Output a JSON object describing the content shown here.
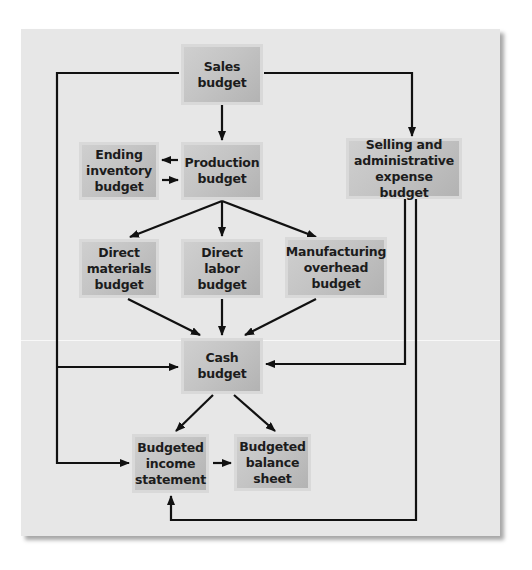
{
  "diagram": {
    "type": "flowchart",
    "title": "",
    "colors": {
      "panel_background": "#e7e7e7",
      "box_fill": "#c4c4c4",
      "box_border": "#d9d9d9",
      "text": "#1c1c1c",
      "arrow": "#111111"
    },
    "nodes": [
      {
        "id": "sales",
        "label": "Sales\nbudget"
      },
      {
        "id": "ending_inventory",
        "label": "Ending\ninventory\nbudget"
      },
      {
        "id": "production",
        "label": "Production\nbudget"
      },
      {
        "id": "selling_admin",
        "label": "Selling and\nadministrative\nexpense budget"
      },
      {
        "id": "direct_materials",
        "label": "Direct\nmaterials\nbudget"
      },
      {
        "id": "direct_labor",
        "label": "Direct\nlabor\nbudget"
      },
      {
        "id": "manufacturing_overhead",
        "label": "Manufacturing\noverhead\nbudget"
      },
      {
        "id": "cash",
        "label": "Cash\nbudget"
      },
      {
        "id": "budgeted_income",
        "label": "Budgeted\nincome\nstatement"
      },
      {
        "id": "budgeted_balance",
        "label": "Budgeted\nbalance\nsheet"
      }
    ],
    "edges": [
      {
        "from": "sales",
        "to": "production"
      },
      {
        "from": "sales",
        "to": "selling_admin"
      },
      {
        "from": "sales",
        "to": "cash"
      },
      {
        "from": "sales",
        "to": "budgeted_income"
      },
      {
        "from": "production",
        "to": "ending_inventory"
      },
      {
        "from": "ending_inventory",
        "to": "production"
      },
      {
        "from": "production",
        "to": "direct_materials"
      },
      {
        "from": "production",
        "to": "direct_labor"
      },
      {
        "from": "production",
        "to": "manufacturing_overhead"
      },
      {
        "from": "direct_materials",
        "to": "cash"
      },
      {
        "from": "direct_labor",
        "to": "cash"
      },
      {
        "from": "manufacturing_overhead",
        "to": "cash"
      },
      {
        "from": "selling_admin",
        "to": "cash"
      },
      {
        "from": "selling_admin",
        "to": "budgeted_income"
      },
      {
        "from": "cash",
        "to": "budgeted_income"
      },
      {
        "from": "cash",
        "to": "budgeted_balance"
      },
      {
        "from": "budgeted_income",
        "to": "budgeted_balance"
      }
    ]
  }
}
